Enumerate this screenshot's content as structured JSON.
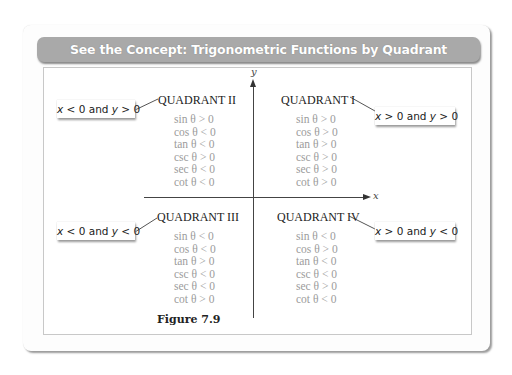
{
  "title": "See the Concept: Trigonometric Functions by Quadrant",
  "axes": {
    "x_label": "x",
    "y_label": "y"
  },
  "quadrants": [
    {
      "name": "QUADRANT I",
      "condition": {
        "x": "x",
        "x_rel": " > 0 and ",
        "y": "y",
        "y_rel": " > 0"
      },
      "functions": [
        "sin θ > 0",
        "cos θ > 0",
        "tan θ > 0",
        "csc θ > 0",
        "sec θ > 0",
        "cot θ > 0"
      ]
    },
    {
      "name": "QUADRANT II",
      "condition": {
        "x": "x",
        "x_rel": " < 0 and ",
        "y": "y",
        "y_rel": " > 0"
      },
      "functions": [
        "sin θ > 0",
        "cos θ < 0",
        "tan θ < 0",
        "csc θ > 0",
        "sec θ < 0",
        "cot θ < 0"
      ]
    },
    {
      "name": "QUADRANT III",
      "condition": {
        "x": "x",
        "x_rel": " < 0 and ",
        "y": "y",
        "y_rel": " < 0"
      },
      "functions": [
        "sin θ < 0",
        "cos θ < 0",
        "tan θ > 0",
        "csc θ < 0",
        "sec θ < 0",
        "cot θ > 0"
      ]
    },
    {
      "name": "QUADRANT IV",
      "condition": {
        "x": "x",
        "x_rel": " > 0 and ",
        "y": "y",
        "y_rel": " < 0"
      },
      "functions": [
        "sin θ < 0",
        "cos θ > 0",
        "tan θ < 0",
        "csc θ < 0",
        "sec θ > 0",
        "cot θ < 0"
      ]
    }
  ],
  "caption": "Figure 7.9",
  "colors": {
    "title_bar": "#a9a9a9",
    "title_text": "#ffffff",
    "function_text": "#9c9c9c",
    "quadrant_text": "#222222"
  }
}
